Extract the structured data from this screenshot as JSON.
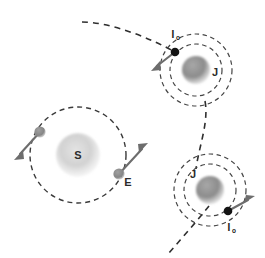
{
  "figure": {
    "background_color": "#ffffff",
    "labels": {
      "sun": "S",
      "earth": "E",
      "jupiter_top": "J",
      "jupiter_bottom": "J",
      "io_top_main": "I",
      "io_top_sub": "o",
      "io_bottom_main": "I",
      "io_bottom_sub": "o"
    },
    "colors": {
      "sun_body": "#cfcfcf",
      "jupiter_body": "#8f8f8f",
      "earth_body": "#8a8a8a",
      "io_body": "#141414",
      "orbit_stroke": "#3a3a3a",
      "trajectory_stroke": "#2f2f2f",
      "arrow_stroke": "#6d6d6d",
      "label_text": "#2b2b2b"
    },
    "systems": [
      {
        "name": "sun-earth-system",
        "center_label": "S",
        "center": {
          "x": 78,
          "y": 155
        },
        "center_radius": 22,
        "orbit_radius": 48,
        "satellites": [
          {
            "name": "earth-upper-left",
            "label": "",
            "position": {
              "x": 40,
              "y": 132
            },
            "radius": 5.5,
            "velocity_arrow": {
              "from_x": 40,
              "from_y": 132,
              "to_x": 16,
              "to_y": 158
            }
          },
          {
            "name": "earth-lower-right",
            "label": "E",
            "position": {
              "x": 119,
              "y": 174
            },
            "radius": 5.5,
            "velocity_arrow": {
              "from_x": 119,
              "from_y": 174,
              "to_x": 146,
              "to_y": 145
            }
          }
        ]
      },
      {
        "name": "jupiter-io-system-top",
        "center_label": "J",
        "center": {
          "x": 196,
          "y": 70
        },
        "center_radius": 14,
        "inner_orbit_radius": 26,
        "outer_orbit_radius": 36,
        "satellites": [
          {
            "name": "io-top",
            "label": "Io",
            "position": {
              "x": 175,
              "y": 52
            },
            "radius": 4.2,
            "velocity_arrow": {
              "from_x": 175,
              "from_y": 52,
              "to_x": 153,
              "to_y": 69
            }
          }
        ]
      },
      {
        "name": "jupiter-io-system-bottom",
        "center_label": "J",
        "center": {
          "x": 210,
          "y": 190
        },
        "center_radius": 14,
        "inner_orbit_radius": 26,
        "outer_orbit_radius": 36,
        "satellites": [
          {
            "name": "io-bottom",
            "label": "Io",
            "position": {
              "x": 228,
              "y": 211
            },
            "radius": 4.2,
            "velocity_arrow": {
              "from_x": 228,
              "from_y": 211,
              "to_x": 252,
              "to_y": 198
            }
          }
        ]
      }
    ],
    "trajectory": {
      "name": "spacecraft-trajectory",
      "description": "Dashed flyby path entering from upper left, passing Io at top Jupiter, continuing down to bottom Jupiter and exiting lower left",
      "segments": [
        "M 82,22 C 110,22 150,38 175,52",
        "M 205,101 C 208,120 200,145 196,168",
        "M 208,206 C 196,220 182,238 168,254"
      ]
    }
  }
}
